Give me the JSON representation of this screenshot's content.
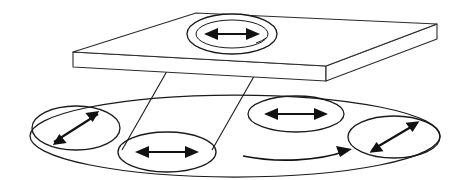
{
  "figure": {
    "background_color": "#ffffff",
    "stroke_color": "#1a1a1a",
    "width": 455,
    "height": 180
  },
  "plate": {
    "name": "apertured-plate",
    "description": "Flat rectangular slab drawn in oblique projection with visible thickness",
    "top_face_points": "73,52 196,13 437,24 326,66",
    "front_face_points": "73,52 73,67 326,81 326,66",
    "right_face_points": "326,66 326,81 437,39 437,24",
    "thickness_px": 15
  },
  "aperture": {
    "name": "plate-aperture",
    "label": "hole in plate",
    "cx": 232,
    "cy": 34,
    "rx": 45,
    "ry": 20,
    "inner_rx": 36,
    "inner_ry": 14,
    "arrow": {
      "name": "aperture-polarization-arrow",
      "orientation": "horizontal",
      "angle_deg": 0,
      "length": 56,
      "double_headed": true
    }
  },
  "beam": {
    "name": "projection-beam",
    "description": "Oblique cylindrical beam connecting plate aperture to disk region B",
    "left_edge": "187,34 122,148",
    "right_edge": "277,34 212,148"
  },
  "disk": {
    "name": "rotating-disk",
    "cx": 235,
    "cy": 136,
    "rx": 205,
    "ry": 41,
    "rotation": {
      "name": "rotation-direction-arrow",
      "direction": "clockwise-viewed-from-above",
      "label": "rotation"
    }
  },
  "regions": [
    {
      "id": "A",
      "name": "disk-region-left",
      "cx": 76,
      "cy": 128,
      "rx": 44,
      "ry": 22,
      "arrow_angle_deg": -40,
      "arrow_length": 58,
      "orientation": "diagonal-up-right"
    },
    {
      "id": "B",
      "name": "disk-region-front",
      "cx": 167,
      "cy": 152,
      "rx": 49,
      "ry": 20,
      "arrow_angle_deg": 0,
      "arrow_length": 62,
      "orientation": "horizontal"
    },
    {
      "id": "C",
      "name": "disk-region-back",
      "cx": 296,
      "cy": 114,
      "rx": 48,
      "ry": 18,
      "arrow_angle_deg": 0,
      "arrow_length": 62,
      "orientation": "horizontal"
    },
    {
      "id": "D",
      "name": "disk-region-right",
      "cx": 394,
      "cy": 137,
      "rx": 46,
      "ry": 21,
      "arrow_angle_deg": -38,
      "arrow_length": 60,
      "orientation": "diagonal-up-right"
    }
  ],
  "rotation_arrow": {
    "name": "disk-rotation-arrow",
    "path": "M 243,156 C 278,162 320,160 348,150",
    "head_at": "end",
    "head_angle_deg": -22
  }
}
